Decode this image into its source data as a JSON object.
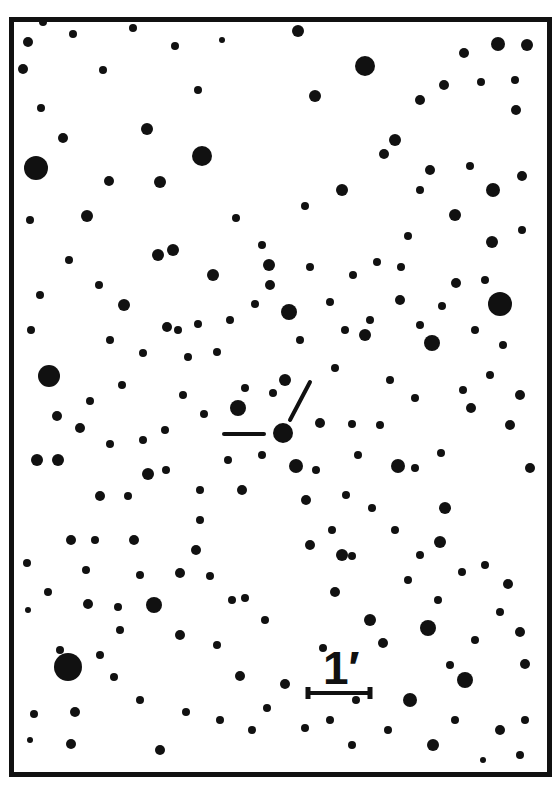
{
  "finding_chart": {
    "scale_bar": {
      "label": "1′",
      "x1": 308,
      "x2": 370,
      "y": 693
    },
    "target": {
      "x": 283,
      "y": 433,
      "r": 10
    },
    "markers": [
      {
        "x1": 224,
        "y1": 434,
        "x2": 264,
        "y2": 434
      },
      {
        "x1": 290,
        "y1": 420,
        "x2": 310,
        "y2": 382
      }
    ],
    "colors": {
      "ink": "#111111",
      "background": "#ffffff"
    },
    "stars": [
      [
        36,
        168,
        12
      ],
      [
        68,
        667,
        14
      ],
      [
        202,
        156,
        10
      ],
      [
        500,
        304,
        12
      ],
      [
        49,
        376,
        11
      ],
      [
        238,
        408,
        8
      ],
      [
        432,
        343,
        8
      ],
      [
        365,
        66,
        10
      ],
      [
        315,
        96,
        6
      ],
      [
        527,
        45,
        6
      ],
      [
        498,
        44,
        7
      ],
      [
        493,
        190,
        7
      ],
      [
        522,
        176,
        5
      ],
      [
        455,
        215,
        6
      ],
      [
        395,
        140,
        6
      ],
      [
        160,
        182,
        6
      ],
      [
        87,
        216,
        6
      ],
      [
        109,
        181,
        5
      ],
      [
        147,
        129,
        6
      ],
      [
        158,
        255,
        6
      ],
      [
        173,
        250,
        6
      ],
      [
        213,
        275,
        6
      ],
      [
        167,
        327,
        5
      ],
      [
        124,
        305,
        6
      ],
      [
        99,
        285,
        4
      ],
      [
        69,
        260,
        4
      ],
      [
        30,
        220,
        4
      ],
      [
        41,
        108,
        4
      ],
      [
        28,
        42,
        5
      ],
      [
        43,
        22,
        4
      ],
      [
        73,
        34,
        4
      ],
      [
        23,
        69,
        5
      ],
      [
        269,
        265,
        6
      ],
      [
        289,
        312,
        8
      ],
      [
        270,
        285,
        5
      ],
      [
        236,
        218,
        4
      ],
      [
        262,
        245,
        4
      ],
      [
        305,
        206,
        4
      ],
      [
        342,
        190,
        6
      ],
      [
        298,
        31,
        6
      ],
      [
        420,
        100,
        5
      ],
      [
        384,
        154,
        5
      ],
      [
        444,
        85,
        5
      ],
      [
        464,
        53,
        5
      ],
      [
        481,
        82,
        4
      ],
      [
        515,
        80,
        4
      ],
      [
        516,
        110,
        5
      ],
      [
        492,
        242,
        6
      ],
      [
        365,
        335,
        6
      ],
      [
        335,
        368,
        4
      ],
      [
        320,
        423,
        5
      ],
      [
        352,
        424,
        4
      ],
      [
        398,
        466,
        7
      ],
      [
        415,
        468,
        4
      ],
      [
        441,
        453,
        4
      ],
      [
        471,
        408,
        5
      ],
      [
        510,
        425,
        5
      ],
      [
        520,
        395,
        5
      ],
      [
        530,
        468,
        5
      ],
      [
        445,
        508,
        6
      ],
      [
        440,
        542,
        6
      ],
      [
        462,
        572,
        4
      ],
      [
        508,
        584,
        5
      ],
      [
        520,
        632,
        5
      ],
      [
        525,
        664,
        5
      ],
      [
        428,
        628,
        8
      ],
      [
        465,
        680,
        8
      ],
      [
        410,
        700,
        7
      ],
      [
        383,
        643,
        5
      ],
      [
        370,
        620,
        6
      ],
      [
        335,
        592,
        5
      ],
      [
        310,
        545,
        5
      ],
      [
        296,
        466,
        7
      ],
      [
        306,
        500,
        5
      ],
      [
        342,
        555,
        6
      ],
      [
        352,
        556,
        4
      ],
      [
        332,
        530,
        4
      ],
      [
        245,
        598,
        4
      ],
      [
        196,
        550,
        5
      ],
      [
        180,
        573,
        5
      ],
      [
        200,
        520,
        4
      ],
      [
        242,
        490,
        5
      ],
      [
        154,
        605,
        8
      ],
      [
        118,
        607,
        4
      ],
      [
        88,
        604,
        5
      ],
      [
        60,
        650,
        4
      ],
      [
        75,
        712,
        5
      ],
      [
        114,
        677,
        4
      ],
      [
        134,
        540,
        5
      ],
      [
        95,
        540,
        4
      ],
      [
        148,
        474,
        6
      ],
      [
        143,
        440,
        4
      ],
      [
        110,
        444,
        4
      ],
      [
        80,
        428,
        5
      ],
      [
        57,
        416,
        5
      ],
      [
        37,
        460,
        6
      ],
      [
        58,
        460,
        6
      ],
      [
        100,
        496,
        5
      ],
      [
        71,
        540,
        5
      ],
      [
        27,
        563,
        4
      ],
      [
        28,
        610,
        3
      ],
      [
        34,
        714,
        4
      ],
      [
        71,
        744,
        5
      ],
      [
        30,
        740,
        3
      ],
      [
        100,
        655,
        4
      ],
      [
        180,
        635,
        5
      ],
      [
        217,
        645,
        4
      ],
      [
        240,
        676,
        5
      ],
      [
        267,
        708,
        4
      ],
      [
        285,
        684,
        5
      ],
      [
        220,
        720,
        4
      ],
      [
        186,
        712,
        4
      ],
      [
        160,
        750,
        5
      ],
      [
        140,
        700,
        4
      ],
      [
        252,
        730,
        4
      ],
      [
        305,
        728,
        4
      ],
      [
        352,
        745,
        4
      ],
      [
        433,
        745,
        6
      ],
      [
        455,
        720,
        4
      ],
      [
        500,
        730,
        5
      ],
      [
        520,
        755,
        4
      ],
      [
        483,
        760,
        3
      ],
      [
        388,
        730,
        4
      ],
      [
        323,
        648,
        4
      ],
      [
        285,
        380,
        6
      ],
      [
        273,
        393,
        4
      ],
      [
        245,
        388,
        4
      ],
      [
        217,
        352,
        4
      ],
      [
        188,
        357,
        4
      ],
      [
        178,
        330,
        4
      ],
      [
        198,
        324,
        4
      ],
      [
        230,
        320,
        4
      ],
      [
        255,
        304,
        4
      ],
      [
        300,
        340,
        4
      ],
      [
        330,
        302,
        4
      ],
      [
        353,
        275,
        4
      ],
      [
        377,
        262,
        4
      ],
      [
        401,
        267,
        4
      ],
      [
        408,
        236,
        4
      ],
      [
        420,
        190,
        4
      ],
      [
        430,
        170,
        5
      ],
      [
        470,
        166,
        4
      ],
      [
        522,
        230,
        4
      ],
      [
        485,
        280,
        4
      ],
      [
        456,
        283,
        5
      ],
      [
        442,
        306,
        4
      ],
      [
        400,
        300,
        5
      ],
      [
        310,
        267,
        4
      ],
      [
        198,
        90,
        4
      ],
      [
        175,
        46,
        4
      ],
      [
        103,
        70,
        4
      ],
      [
        222,
        40,
        3
      ],
      [
        133,
        28,
        4
      ],
      [
        63,
        138,
        5
      ],
      [
        40,
        295,
        4
      ],
      [
        31,
        330,
        4
      ],
      [
        110,
        340,
        4
      ],
      [
        143,
        353,
        4
      ],
      [
        122,
        385,
        4
      ],
      [
        90,
        401,
        4
      ],
      [
        183,
        395,
        4
      ],
      [
        204,
        414,
        4
      ],
      [
        228,
        460,
        4
      ],
      [
        262,
        455,
        4
      ],
      [
        166,
        470,
        4
      ],
      [
        128,
        496,
        4
      ],
      [
        200,
        490,
        4
      ],
      [
        165,
        430,
        4
      ],
      [
        346,
        495,
        4
      ],
      [
        358,
        455,
        4
      ],
      [
        380,
        425,
        4
      ],
      [
        390,
        380,
        4
      ],
      [
        415,
        398,
        4
      ],
      [
        463,
        390,
        4
      ],
      [
        490,
        375,
        4
      ],
      [
        503,
        345,
        4
      ],
      [
        475,
        330,
        4
      ],
      [
        420,
        325,
        4
      ],
      [
        370,
        320,
        4
      ],
      [
        345,
        330,
        4
      ],
      [
        316,
        470,
        4
      ],
      [
        372,
        508,
        4
      ],
      [
        395,
        530,
        4
      ],
      [
        420,
        555,
        4
      ],
      [
        408,
        580,
        4
      ],
      [
        438,
        600,
        4
      ],
      [
        485,
        565,
        4
      ],
      [
        500,
        612,
        4
      ],
      [
        475,
        640,
        4
      ],
      [
        450,
        665,
        4
      ],
      [
        525,
        720,
        4
      ],
      [
        356,
        700,
        4
      ],
      [
        330,
        720,
        4
      ],
      [
        265,
        620,
        4
      ],
      [
        232,
        600,
        4
      ],
      [
        210,
        576,
        4
      ],
      [
        140,
        575,
        4
      ],
      [
        120,
        630,
        4
      ],
      [
        48,
        592,
        4
      ],
      [
        86,
        570,
        4
      ]
    ]
  }
}
